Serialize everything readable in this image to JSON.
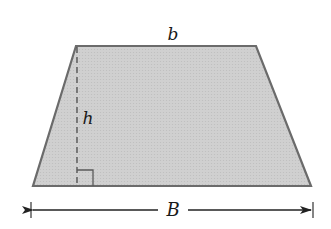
{
  "figure": {
    "shape": "trapezoid",
    "colors": {
      "fill": "#cdcdcd",
      "stroke": "#6b6b6b",
      "dashed_line": "#4a4a4a",
      "dimension_line": "#222222",
      "background": "#ffffff"
    },
    "vertices": {
      "top_left": [
        76,
        46
      ],
      "top_right": [
        256,
        46
      ],
      "bottom_right": [
        311,
        186
      ],
      "bottom_left": [
        33,
        186
      ]
    },
    "labels": {
      "top_base": "b",
      "height": "h",
      "bottom_base": "B"
    },
    "label_positions": {
      "top_base": [
        173,
        34
      ],
      "height": [
        88,
        118
      ],
      "bottom_base": [
        173,
        210
      ]
    },
    "height_line": {
      "x": 77,
      "y_top": 46,
      "y_bottom": 186,
      "style": "dashed"
    },
    "right_angle_marker": {
      "x": 77,
      "y": 170,
      "size": 16
    },
    "dimension_arrow": {
      "y": 210,
      "x_left": 31,
      "x_right": 313
    }
  }
}
